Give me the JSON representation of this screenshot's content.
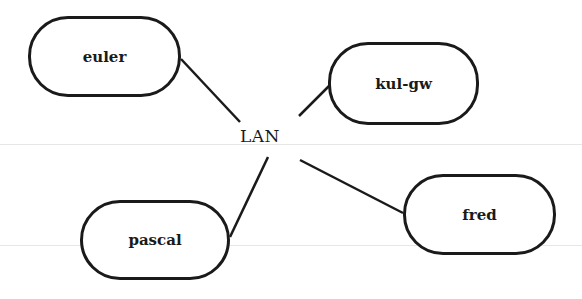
{
  "diagram": {
    "type": "star-network",
    "hub": {
      "label": "LAN",
      "x": 240,
      "y": 126
    },
    "nodes": [
      {
        "id": "euler",
        "label": "euler",
        "x": 28,
        "y": 16,
        "w": 153,
        "h": 81
      },
      {
        "id": "kul-gw",
        "label": "kul-gw",
        "x": 328,
        "y": 42,
        "w": 151,
        "h": 83
      },
      {
        "id": "pascal",
        "label": "pascal",
        "x": 80,
        "y": 200,
        "w": 150,
        "h": 80
      },
      {
        "id": "fred",
        "label": "fred",
        "x": 403,
        "y": 174,
        "w": 153,
        "h": 81
      }
    ],
    "edges": [
      {
        "from": "LAN",
        "to": "euler"
      },
      {
        "from": "LAN",
        "to": "kul-gw"
      },
      {
        "from": "LAN",
        "to": "pascal"
      },
      {
        "from": "LAN",
        "to": "fred"
      }
    ],
    "colors": {
      "stroke": "#1a1a1a",
      "background": "#ffffff"
    }
  }
}
